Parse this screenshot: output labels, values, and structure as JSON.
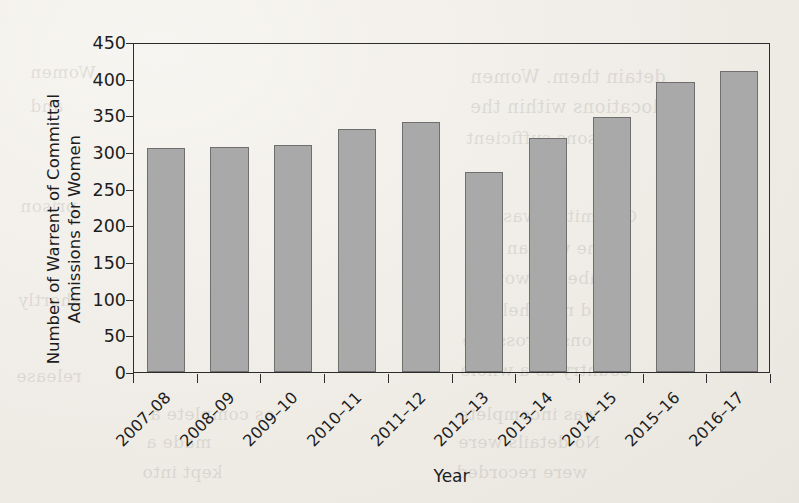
{
  "chart_data": {
    "type": "bar",
    "title": "",
    "subtitle": "",
    "xlabel": "Year",
    "ylabel": "Number of Warrent of Committal Admissions for Women",
    "categories": [
      "2007–08",
      "2008–09",
      "2009–10",
      "2010–11",
      "2011–12",
      "2012–13",
      "2013–14",
      "2014–15",
      "2015–16",
      "2016–17"
    ],
    "values": [
      305,
      307,
      309,
      331,
      341,
      273,
      319,
      348,
      396,
      411
    ],
    "ylim": [
      0,
      450
    ],
    "yticks": [
      0,
      50,
      100,
      150,
      200,
      250,
      300,
      350,
      400,
      450
    ],
    "ytick_labels": [
      "0",
      "50",
      "100",
      "150",
      "200",
      "250",
      "300",
      "350",
      "400",
      "450"
    ],
    "grid": false,
    "legend": null,
    "legend_position": "none",
    "bar_fill_color": "#a9a9a9",
    "bar_edge_color": "#6f6f6f",
    "axis_color": "#2c2c2c",
    "background_color": "#f3f1ec",
    "xtick_label_rotation": -45,
    "annotations": []
  },
  "ghost_text": [
    {
      "text": "detain them. Women",
      "x": 470,
      "y": 66,
      "size": 18
    },
    {
      "text": "locations within the",
      "x": 470,
      "y": 96,
      "size": 18
    },
    {
      "text": "reasons sufficient",
      "x": 466,
      "y": 128,
      "size": 17
    },
    {
      "text": "Committal was the",
      "x": 468,
      "y": 206,
      "size": 17
    },
    {
      "text": "so the woman was",
      "x": 466,
      "y": 238,
      "size": 17
    },
    {
      "text": "number of women",
      "x": 466,
      "y": 268,
      "size": 17
    },
    {
      "text": "and men held in",
      "x": 468,
      "y": 300,
      "size": 17
    },
    {
      "text": "prisons across the",
      "x": 462,
      "y": 330,
      "size": 17
    },
    {
      "text": "country as a whole",
      "x": 460,
      "y": 360,
      "size": 17
    },
    {
      "text": "was incomplete",
      "x": 458,
      "y": 404,
      "size": 17
    },
    {
      "text": "No details were",
      "x": 458,
      "y": 432,
      "size": 17
    },
    {
      "text": "were recorded",
      "x": 456,
      "y": 462,
      "size": 17
    },
    {
      "text": "Women",
      "x": 30,
      "y": 62,
      "size": 17
    },
    {
      "text": "and",
      "x": 30,
      "y": 96,
      "size": 17
    },
    {
      "text": "prison",
      "x": 20,
      "y": 196,
      "size": 17
    },
    {
      "text": "shortly",
      "x": 18,
      "y": 290,
      "size": 17
    },
    {
      "text": "release",
      "x": 16,
      "y": 366,
      "size": 17
    },
    {
      "text": "as complete a",
      "x": 150,
      "y": 404,
      "size": 17
    },
    {
      "text": "made a",
      "x": 146,
      "y": 432,
      "size": 17
    },
    {
      "text": "kept into",
      "x": 142,
      "y": 462,
      "size": 17
    }
  ]
}
